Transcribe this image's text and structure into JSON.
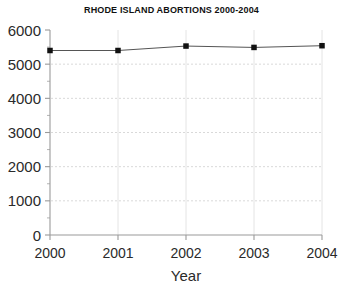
{
  "chart_data": {
    "type": "line",
    "title": "RHODE ISLAND ABORTIONS 2000-2004",
    "xlabel": "Year",
    "ylabel": "",
    "categories": [
      "2000",
      "2001",
      "2002",
      "2003",
      "2004"
    ],
    "x": [
      2000,
      2001,
      2002,
      2003,
      2004
    ],
    "values": [
      5400,
      5400,
      5530,
      5490,
      5540
    ],
    "series": [
      {
        "name": "Abortions",
        "values": [
          5400,
          5400,
          5530,
          5490,
          5540
        ]
      }
    ],
    "ylim": [
      0,
      6000
    ],
    "xlim": [
      2000,
      2004
    ],
    "ytick_labels": [
      "0",
      "1000",
      "2000",
      "3000",
      "4000",
      "5000",
      "6000"
    ],
    "ytick_values": [
      0,
      1000,
      2000,
      3000,
      4000,
      5000,
      6000
    ],
    "yminor_step": 500,
    "xtick_labels": [
      "2000",
      "2001",
      "2002",
      "2003",
      "2004"
    ],
    "grid": "horizontal-dashed",
    "legend": "none",
    "marker": "square",
    "colors": {
      "line": "#555555",
      "marker": "#111111",
      "grid": "#d9d9d9",
      "axis": "#9a9a9a",
      "text": "#2a2a2a",
      "background": "#ffffff"
    }
  }
}
